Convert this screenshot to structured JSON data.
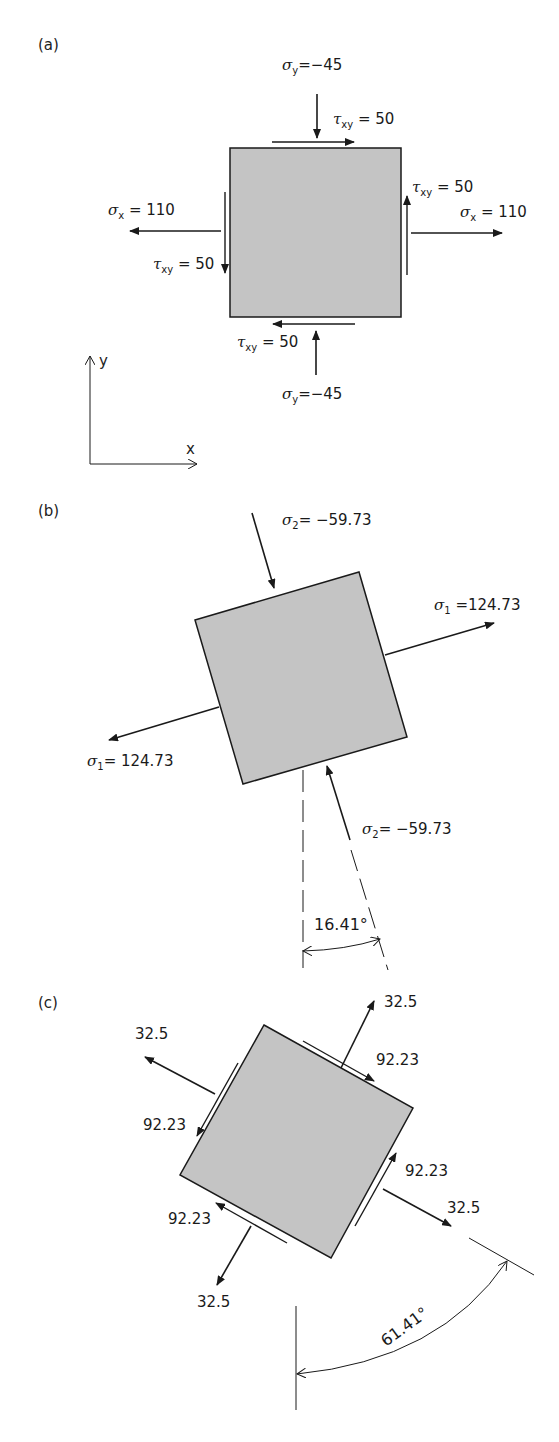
{
  "panels": {
    "a": {
      "label": "(a)",
      "sigma_y_top": {
        "sym": "σ",
        "sub": "y",
        "eq": "=−45"
      },
      "tau_top": {
        "sym": "τ",
        "sub": "xy",
        "eq": " = 50"
      },
      "tau_right": {
        "sym": "τ",
        "sub": "xy",
        "eq": " = 50"
      },
      "sigma_x_right": {
        "sym": "σ",
        "sub": "x",
        "eq": " = 110"
      },
      "sigma_x_left": {
        "sym": "σ",
        "sub": "x",
        "eq": " = 110"
      },
      "tau_left": {
        "sym": "τ",
        "sub": "xy",
        "eq": " = 50"
      },
      "tau_bottom": {
        "sym": "τ",
        "sub": "xy",
        "eq": " = 50"
      },
      "sigma_y_bottom": {
        "sym": "σ",
        "sub": "y",
        "eq": "=−45"
      },
      "axes": {
        "x": "x",
        "y": "y"
      }
    },
    "b": {
      "label": "(b)",
      "sigma2_top": {
        "sym": "σ",
        "sub": "2",
        "eq": "= −59.73"
      },
      "sigma1_right": {
        "sym": "σ",
        "sub": "1",
        "eq": " =124.73"
      },
      "sigma1_left": {
        "sym": "σ",
        "sub": "1",
        "eq": "= 124.73"
      },
      "sigma2_bottom": {
        "sym": "σ",
        "sub": "2",
        "eq": "= −59.73"
      },
      "angle": "16.41°"
    },
    "c": {
      "label": "(c)",
      "normal_top_right": "32.5",
      "normal_top_left": "32.5",
      "normal_bottom_right": "32.5",
      "normal_bottom_left": "32.5",
      "shear_top_right": "92.23",
      "shear_top_left": "92.23",
      "shear_bottom_right": "92.23",
      "shear_bottom_left": "92.23",
      "angle": "61.41°"
    }
  },
  "colors": {
    "element_fill": "#c4c4c4",
    "stroke": "#1a1a1a"
  }
}
